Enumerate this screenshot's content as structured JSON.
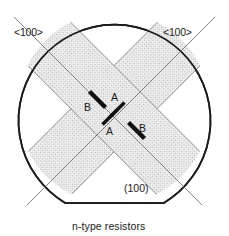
{
  "figure": {
    "name": "n-type-resistor-wafer-orientation-diagram",
    "caption": "n-type resistors",
    "wafer": {
      "plane_label": "(100)",
      "outline_color": "#1a1a1a",
      "fill_color": "#ffffff",
      "flat_orientation": "bottom",
      "center_x": 114,
      "center_y": 108,
      "radius": 96
    },
    "directions": [
      {
        "id": "dir-left",
        "label": "<100>",
        "angle_deg": 45,
        "color": "#6b6b6b"
      },
      {
        "id": "dir-right",
        "label": "<100>",
        "angle_deg": 135,
        "color": "#6b6b6b"
      }
    ],
    "strips": [
      {
        "id": "strip-ne",
        "angle_deg": -45,
        "fill_color": "#d9d9d9",
        "edge_color": "#8c8c8c"
      },
      {
        "id": "strip-se",
        "angle_deg": 45,
        "fill_color": "#d9d9d9",
        "edge_color": "#8c8c8c"
      }
    ],
    "resistors": [
      {
        "id": "resistor-b-upper",
        "label": "B",
        "orientation": "perpendicular",
        "color": "#111111"
      },
      {
        "id": "resistor-b-lower",
        "label": "B",
        "orientation": "perpendicular",
        "color": "#111111"
      },
      {
        "id": "resistor-a-upper",
        "label": "A",
        "orientation": "parallel",
        "color": "#111111"
      },
      {
        "id": "resistor-a-lower",
        "label": "A",
        "orientation": "parallel",
        "color": "#111111"
      }
    ],
    "labels": {
      "dir_left": "<100>",
      "dir_right": "<100>",
      "a_upper": "A",
      "a_lower": "A",
      "b_upper": "B",
      "b_lower": "B",
      "plane": "(100)",
      "caption": "n-type resistors"
    }
  }
}
